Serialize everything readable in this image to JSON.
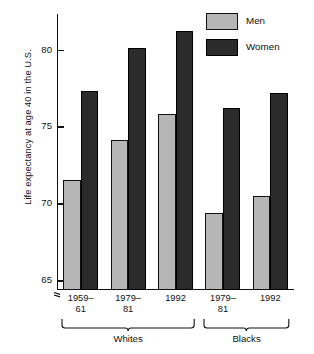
{
  "chart_data": {
    "type": "bar",
    "title": "",
    "xlabel": "",
    "ylabel": "Life expectancy at age 40 in the U.S.",
    "ylim": [
      64.3,
      82.3
    ],
    "y_axis_broken": true,
    "y_ticks": [
      65,
      70,
      75,
      80
    ],
    "y_tick_labels": [
      "65",
      "70",
      "75",
      "80"
    ],
    "grid": false,
    "legend_position": "top-right",
    "categories": [
      "1959–61",
      "1979–81",
      "1992",
      "1979–81",
      "1992"
    ],
    "groups": [
      {
        "name": "Whites",
        "categories": [
          "1959–61",
          "1979–81",
          "1992"
        ]
      },
      {
        "name": "Blacks",
        "categories": [
          "1979–81",
          "1992"
        ]
      }
    ],
    "series": [
      {
        "name": "Men",
        "color": "#b6b6b6",
        "values": [
          71.5,
          74.1,
          75.8,
          69.4,
          70.5
        ]
      },
      {
        "name": "Women",
        "color": "#2b2b2b",
        "values": [
          77.3,
          80.1,
          81.2,
          76.2,
          77.2
        ]
      }
    ],
    "bars": [
      {
        "group": "Whites",
        "category": "1959–61",
        "series": "Men",
        "value": 71.5
      },
      {
        "group": "Whites",
        "category": "1959–61",
        "series": "Women",
        "value": 77.3
      },
      {
        "group": "Whites",
        "category": "1979–81",
        "series": "Men",
        "value": 74.1
      },
      {
        "group": "Whites",
        "category": "1979–81",
        "series": "Women",
        "value": 80.1
      },
      {
        "group": "Whites",
        "category": "1992",
        "series": "Men",
        "value": 75.8
      },
      {
        "group": "Whites",
        "category": "1992",
        "series": "Women",
        "value": 81.2
      },
      {
        "group": "Blacks",
        "category": "1979–81",
        "series": "Men",
        "value": 69.4
      },
      {
        "group": "Blacks",
        "category": "1979–81",
        "series": "Women",
        "value": 76.2
      },
      {
        "group": "Blacks",
        "category": "1992",
        "series": "Men",
        "value": 70.5
      },
      {
        "group": "Blacks",
        "category": "1992",
        "series": "Women",
        "value": 77.2
      }
    ]
  },
  "legend": {
    "items": [
      {
        "label": "Men",
        "color": "#b6b6b6"
      },
      {
        "label": "Women",
        "color": "#2b2b2b"
      }
    ]
  },
  "axis": {
    "y_label": "Life expectancy at age 40 in the U.S.",
    "y_ticks": [
      "65",
      "70",
      "75",
      "80"
    ],
    "x_tick_lines": [
      [
        "1959–",
        "61"
      ],
      [
        "1979–",
        "81"
      ],
      [
        "1992",
        ""
      ],
      [
        "1979–",
        "81"
      ],
      [
        "1992",
        ""
      ]
    ],
    "group_labels": [
      "Whites",
      "Blacks"
    ]
  }
}
